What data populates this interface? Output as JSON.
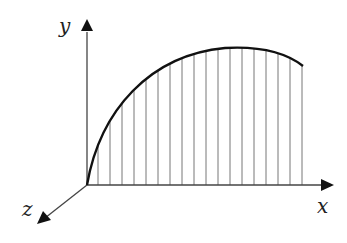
{
  "diagram": {
    "title": "",
    "axes": {
      "x_label": "x",
      "y_label": "y",
      "z_label": "z"
    },
    "origin": [
      87,
      185
    ],
    "curve": "concave curve rising from origin, peaking near x=230, ending at x=303",
    "hatch_lines": {
      "count": 18,
      "start_x": 98,
      "spacing": 12
    },
    "colors": {
      "curve": "#111111",
      "axis": "#444444",
      "hatch": "#777777"
    }
  }
}
